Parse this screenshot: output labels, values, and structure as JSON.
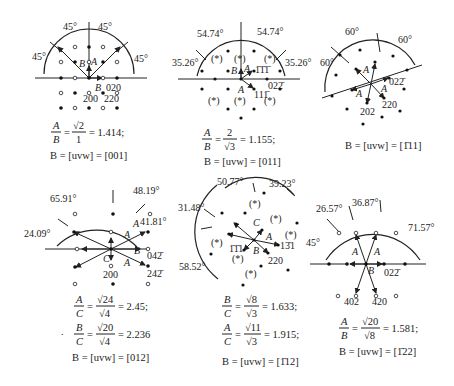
{
  "panels": [
    {
      "id": "001",
      "angles": [
        "45°",
        "45°",
        "45°",
        "45°"
      ],
      "vector_labels": [
        "A",
        "B",
        "B"
      ],
      "spot_labels": [
        "020",
        "200",
        "220"
      ],
      "equation": {
        "lhs_num": "A",
        "lhs_den": "B",
        "rhs_num": "√2",
        "rhs_den": "1",
        "result": "= 1.414;"
      },
      "zone_axis": "B = [uvw] = [001]"
    },
    {
      "id": "011",
      "angles": [
        "54.74°",
        "54.74°",
        "35.26°",
        "35.26°"
      ],
      "vector_labels": [
        "A",
        "B",
        "A"
      ],
      "spot_labels": [
        "1̄1̄1̄",
        "022̄",
        "111̄"
      ],
      "kinematic_mark": "(*)",
      "equation": {
        "lhs_num": "A",
        "lhs_den": "B",
        "rhs_num": "2",
        "rhs_den": "√3",
        "result": "= 1.155;"
      },
      "zone_axis": "B = [uvw] = [011]"
    },
    {
      "id": "-111",
      "angles": [
        "60°",
        "60°",
        "60°"
      ],
      "vector_labels": [
        "A",
        "A",
        "A"
      ],
      "spot_labels": [
        "022̄",
        "220",
        "202"
      ],
      "zone_axis": "B = [uvw] = [1̄11]"
    },
    {
      "id": "012",
      "angles": [
        "65.91°",
        "48.19°",
        "41.81°",
        "24.09°"
      ],
      "vector_labels": [
        "A",
        "A",
        "B",
        "C",
        "A"
      ],
      "spot_labels": [
        "042̄",
        "200",
        "242̄"
      ],
      "equations": [
        {
          "lhs_num": "A",
          "lhs_den": "C",
          "rhs_num": "√24",
          "rhs_den": "√4",
          "result": "= 2.45;"
        },
        {
          "lhs_num": "B",
          "lhs_den": "C",
          "rhs_num": "√20",
          "rhs_den": "√4",
          "result": "= 2.236"
        }
      ],
      "zone_axis": "B = [uvw] = [012]"
    },
    {
      "id": "-112",
      "angles": [
        "50.77°",
        "39.23°",
        "31.48°",
        "58.52°"
      ],
      "vector_labels": [
        "C",
        "A",
        "B"
      ],
      "spot_labels": [
        "13̄1",
        "1̄1̄1",
        "220"
      ],
      "kinematic_mark": "(*)",
      "equations": [
        {
          "lhs_num": "B",
          "lhs_den": "C",
          "rhs_num": "√8",
          "rhs_den": "√3",
          "result": "= 1.633;"
        },
        {
          "lhs_num": "A",
          "lhs_den": "C",
          "rhs_num": "√11",
          "rhs_den": "√3",
          "result": "= 1.915;"
        }
      ],
      "zone_axis": "B = [uvw] = [1̄12]"
    },
    {
      "id": "-122",
      "angles": [
        "26.57°",
        "36.87°",
        "71.57°",
        "45°"
      ],
      "vector_labels": [
        "A",
        "A",
        "B"
      ],
      "spot_labels": [
        "022̄",
        "402",
        "420"
      ],
      "equation": {
        "lhs_num": "A",
        "lhs_den": "B",
        "rhs_num": "√20",
        "rhs_den": "√8",
        "result": "= 1.581;"
      },
      "zone_axis": "B = [uvw] = [1̄22]"
    }
  ]
}
